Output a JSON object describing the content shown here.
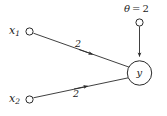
{
  "diagram": {
    "type": "perceptron-neuron",
    "background_color": "#ffffff",
    "stroke_color": "#2a2a2a",
    "text_color": "#1b1b1b",
    "inputs": [
      {
        "label": "x",
        "subscript": "1",
        "weight": "2"
      },
      {
        "label": "x",
        "subscript": "2",
        "weight": "2"
      }
    ],
    "threshold": {
      "symbol": "θ",
      "equals": "=",
      "value": "2",
      "full_text": "θ = 2"
    },
    "output": {
      "label": "y"
    }
  }
}
